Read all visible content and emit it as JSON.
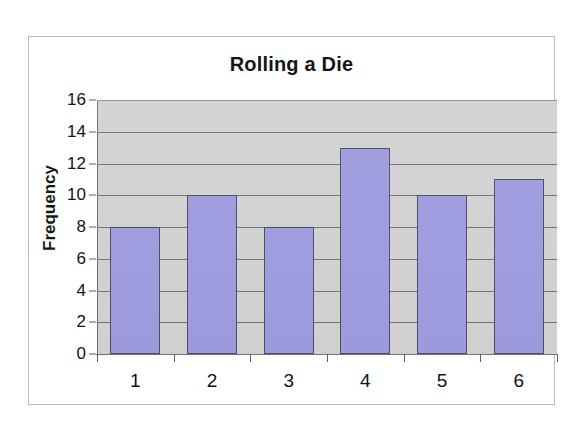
{
  "chart_data": {
    "type": "bar",
    "title": "Rolling a Die",
    "xlabel": "",
    "ylabel": "Frequency",
    "categories": [
      "1",
      "2",
      "3",
      "4",
      "5",
      "6"
    ],
    "values": [
      8,
      10,
      8,
      13,
      10,
      11
    ],
    "ylim": [
      0,
      16
    ],
    "ytick_step": 2,
    "yticks": [
      "0",
      "2",
      "4",
      "6",
      "8",
      "10",
      "12",
      "14",
      "16"
    ],
    "grid": true,
    "legend": false,
    "legend_position": "none",
    "series": [
      {
        "name": "Frequency",
        "values": [
          8,
          10,
          8,
          13,
          10,
          11
        ]
      }
    ],
    "colors": {
      "bar_fill": "#9e9be0",
      "bar_border": "#4d4d63",
      "plot_background": "#d2d2d2",
      "gridline": "#6f7276",
      "axis": "#6a6d71",
      "text": "#121212",
      "frame_border": "#b9b9bb",
      "page_background": "#ffffff"
    }
  }
}
